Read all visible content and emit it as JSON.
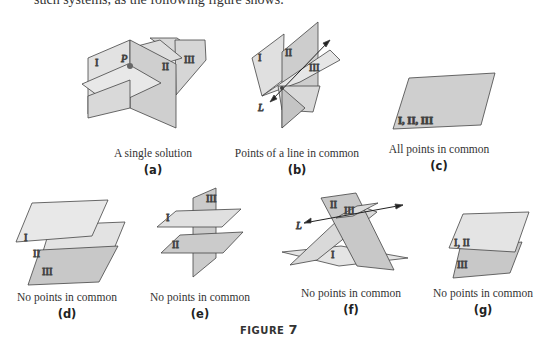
{
  "top_text": "such systems, as the following figure shows.",
  "figure": {
    "title_prefix": "FIGURE",
    "title_number": "7",
    "panels": [
      {
        "id": "a",
        "label": "(a)",
        "caption": "A single solution",
        "plane_labels": [
          "I",
          "II",
          "III"
        ],
        "point_label": "P"
      },
      {
        "id": "b",
        "label": "(b)",
        "caption": "Points of a line in common",
        "plane_labels": [
          "I",
          "II",
          "III"
        ],
        "line_label": "L"
      },
      {
        "id": "c",
        "label": "(c)",
        "caption": "All points in common",
        "plane_labels": [
          "I, II, III"
        ]
      },
      {
        "id": "d",
        "label": "(d)",
        "caption": "No points in common",
        "plane_labels": [
          "I",
          "II",
          "III"
        ]
      },
      {
        "id": "e",
        "label": "(e)",
        "caption": "No points in common",
        "plane_labels": [
          "I",
          "II",
          "III"
        ]
      },
      {
        "id": "f",
        "label": "(f)",
        "caption": "No points in common",
        "plane_labels": [
          "I",
          "II",
          "III"
        ],
        "line_label": "L"
      },
      {
        "id": "g",
        "label": "(g)",
        "caption": "No points in common",
        "plane_labels": [
          "I, II",
          "III"
        ]
      }
    ]
  },
  "colors": {
    "plane_light": "#e4e4e4",
    "plane_mid": "#d0d0d0",
    "plane_dark": "#bdbdbd",
    "edge": "#444444"
  }
}
